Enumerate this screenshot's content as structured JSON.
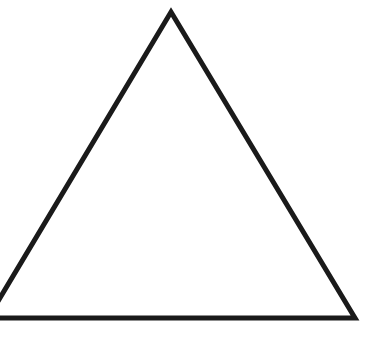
{
  "diagram": {
    "shape": "triangle-outline",
    "stroke_color": "#1a1a1a",
    "fill_color": "none",
    "background": "#ffffff",
    "stroke_width": 5,
    "vertices": {
      "apex": [
        171,
        12
      ],
      "bottom_right": [
        355,
        318
      ],
      "bottom_left": [
        -12,
        318
      ]
    }
  }
}
